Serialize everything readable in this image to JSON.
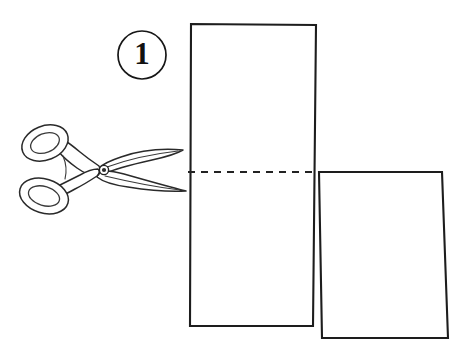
{
  "figure": {
    "background_color": "#ffffff",
    "ink_color": "#1a1a1a",
    "width": 455,
    "height": 351
  },
  "step_badge": {
    "number": "1",
    "shape": "circle",
    "center_x": 142,
    "center_y": 55,
    "radius": 24,
    "stroke_color": "#161616",
    "fill_color": "#ffffff"
  },
  "cut_line": {
    "style": "dashed",
    "label": "cut-line",
    "y": 172,
    "x_start": 188,
    "x_end": 318,
    "dash_length": 7,
    "gap_length": 6,
    "color": "#222222"
  },
  "sheets": [
    {
      "name": "upper-sheet",
      "description": "tall vertical sheet of paper behind, spanning full height",
      "points": "191,24 316,25 313,326 190,326",
      "fill_color": "#ffffff",
      "stroke_color": "#1d1d1d"
    },
    {
      "name": "lower-sheet",
      "description": "second sheet overlapping to the lower right",
      "points": "319,172 442,172 448,338 322,338",
      "fill_color": "#ffffff",
      "stroke_color": "#1d1d1d"
    }
  ],
  "scissors": {
    "name": "scissors",
    "orientation": "blades pointing right toward the cut line",
    "pivot": {
      "x": 104,
      "y": 170,
      "radius": 4
    },
    "handles": [
      {
        "name": "upper-handle-ring",
        "cx": 45,
        "cy": 143,
        "rx": 22,
        "ry": 16,
        "rotation": -22
      },
      {
        "name": "lower-handle-ring",
        "cx": 44,
        "cy": 196,
        "rx": 23,
        "ry": 16,
        "rotation": 17
      }
    ],
    "blades": [
      {
        "name": "upper-blade",
        "tip_x": 183,
        "tip_y": 150
      },
      {
        "name": "lower-blade",
        "tip_x": 186,
        "tip_y": 191
      }
    ],
    "stroke_color": "#2a2a2a"
  }
}
